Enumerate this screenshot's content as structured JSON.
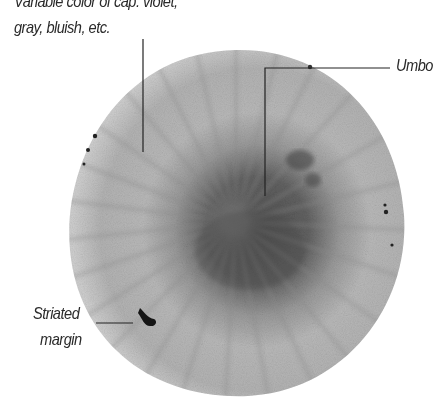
{
  "figure": {
    "annotations": {
      "color_line1": "Variable color of cap: violet,",
      "color_line2": "gray, bluish, etc.",
      "umbo": "Umbo",
      "margin_line1": "Striated",
      "margin_line2": "margin"
    },
    "colors": {
      "background": "#ffffff",
      "cap_outer": "#b8b8b8",
      "cap_center": "#5a5a5a",
      "leader_line": "#222222",
      "text": "#2a2a2a"
    }
  }
}
